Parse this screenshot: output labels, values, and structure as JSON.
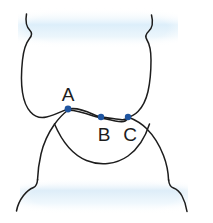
{
  "figure": {
    "background_color": "#ffffff",
    "outline_color": "#1d1d1d",
    "band_color": "#e3f0f7",
    "marker_color": "#1f55a0",
    "width": 213,
    "height": 223
  },
  "bands": {
    "top": {
      "name": "upper-gingival-band",
      "color": "#e3f0f7"
    },
    "bottom": {
      "name": "lower-gingival-band",
      "color": "#e3f0f7"
    }
  },
  "points": [
    {
      "id": "A",
      "label": "A",
      "x": 68,
      "y": 109,
      "label_x": 68,
      "label_y": 101
    },
    {
      "id": "B",
      "label": "B",
      "x": 101,
      "y": 117,
      "label_x": 104,
      "label_y": 141
    },
    {
      "id": "C",
      "label": "C",
      "x": 128,
      "y": 117,
      "label_x": 130,
      "label_y": 141
    }
  ],
  "structures": {
    "upper_tooth": "upper-tooth-outline",
    "lower_tooth": "lower-tooth-outline",
    "contact_curve_upper": "contact-curve-upper",
    "contact_curve_lower": "contact-curve-lower"
  }
}
